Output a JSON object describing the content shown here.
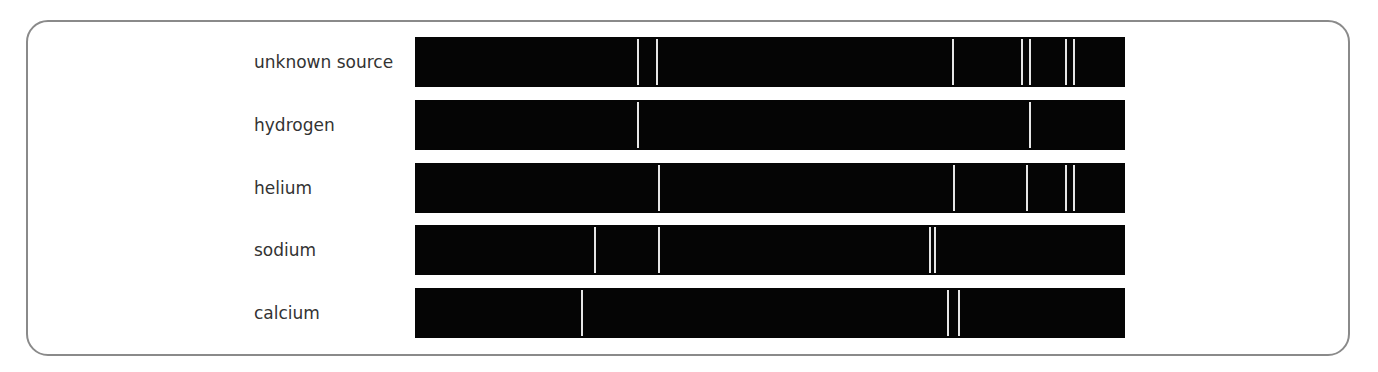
{
  "figure": {
    "bar_left_px": 415,
    "bar_width_px": 710
  },
  "spectra": [
    {
      "label": "unknown source",
      "top": 37,
      "lines": [
        638,
        657,
        953,
        1022,
        1030,
        1066,
        1074
      ]
    },
    {
      "label": "hydrogen",
      "top": 100,
      "lines": [
        638,
        1030
      ]
    },
    {
      "label": "helium",
      "top": 163,
      "lines": [
        659,
        954,
        1027,
        1066,
        1074
      ]
    },
    {
      "label": "sodium",
      "top": 225,
      "lines": [
        595,
        659,
        930,
        935
      ]
    },
    {
      "label": "calcium",
      "top": 288,
      "lines": [
        582,
        948,
        959
      ]
    }
  ],
  "colors": {
    "bar": "#050505",
    "line": "#e6e6e6",
    "border": "#8a8a8a",
    "label": "#333333"
  }
}
